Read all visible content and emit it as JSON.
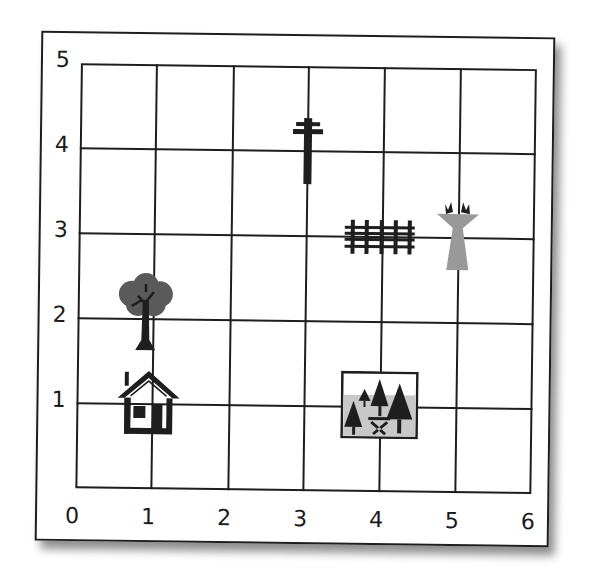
{
  "diagram": {
    "type": "coordinate-grid-map",
    "x_axis": {
      "labels": [
        "0",
        "1",
        "2",
        "3",
        "4",
        "5",
        "6"
      ],
      "min": 0,
      "max": 6
    },
    "y_axis": {
      "labels": [
        "5",
        "4",
        "3",
        "2",
        "1"
      ],
      "min": 0,
      "max": 5
    },
    "landmarks": [
      {
        "name": "house",
        "icon": "house-icon",
        "x": 1,
        "y": 1
      },
      {
        "name": "tree",
        "icon": "tree-icon",
        "x": 1,
        "y": 2
      },
      {
        "name": "utility pole",
        "icon": "utility-pole-icon",
        "x": 3,
        "y": 4
      },
      {
        "name": "fence",
        "icon": "fence-icon",
        "x": 3.5,
        "y": 3
      },
      {
        "name": "flower pot",
        "icon": "flower-pot-icon",
        "x": 5,
        "y": 3
      },
      {
        "name": "picnic area",
        "icon": "picnic-area-icon",
        "x": 4,
        "y": 1
      }
    ],
    "colors": {
      "line": "#1e1e1e",
      "tree_canopy": "#555555",
      "flower_pot": "#999999",
      "picnic_bg": "#c8c8c8"
    }
  }
}
